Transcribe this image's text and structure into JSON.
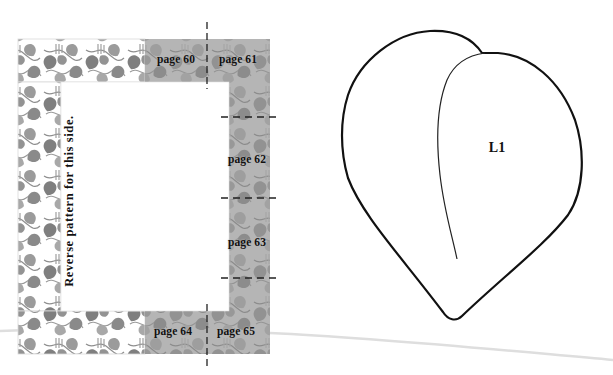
{
  "frame_pattern": {
    "name": "vine-leaf border frame",
    "side_note": "Reverse pattern for this side.",
    "page_labels": [
      {
        "id": "p60",
        "label": "page 60",
        "x": 157,
        "y": 54
      },
      {
        "id": "p61",
        "label": "page 61",
        "x": 219,
        "y": 54
      },
      {
        "id": "p62",
        "label": "page 62",
        "x": 228,
        "y": 154
      },
      {
        "id": "p63",
        "label": "page 63",
        "x": 228,
        "y": 237
      },
      {
        "id": "p64",
        "label": "page 64",
        "x": 154,
        "y": 326
      },
      {
        "id": "p65",
        "label": "page 65",
        "x": 217,
        "y": 326
      }
    ],
    "colors": {
      "shaded_bg": "#b5b5b5",
      "leaf_dark": "#8c8c8c",
      "leaf_mid": "#9e9e9e",
      "frame_border": "#d9d9d9",
      "dash": "#222222"
    }
  },
  "leaf_template": {
    "label": "L1",
    "stroke": "#111111"
  }
}
